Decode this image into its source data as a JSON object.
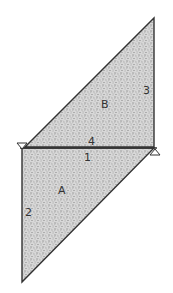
{
  "diagram": {
    "colors": {
      "stroke": "#333333",
      "fill": "#cfcfcf",
      "background": "#ffffff"
    },
    "regions": [
      {
        "id": "B",
        "label": "B",
        "points": [
          [
            25,
            147
          ],
          [
            154,
            18
          ],
          [
            154,
            147
          ]
        ]
      },
      {
        "id": "A",
        "label": "A",
        "points": [
          [
            22,
            148
          ],
          [
            154,
            148
          ],
          [
            22,
            282
          ]
        ]
      }
    ],
    "edge_labels": {
      "e1": "1",
      "e2": "2",
      "e3": "3",
      "e4": "4"
    },
    "region_labels": {
      "A": "A",
      "B": "B"
    },
    "markers": [
      {
        "type": "triangle-down",
        "x": 22,
        "y": 147
      },
      {
        "type": "triangle-up",
        "x": 155,
        "y": 151
      }
    ]
  }
}
